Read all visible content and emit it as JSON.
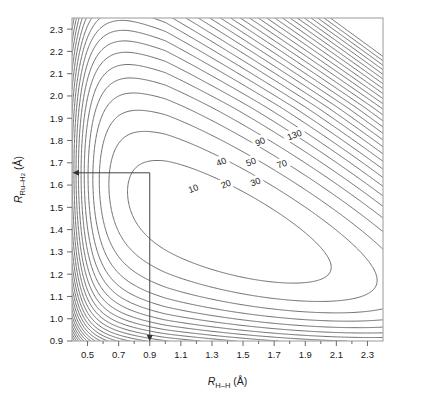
{
  "figure": {
    "kind": "contour-plot",
    "background": "#ffffff",
    "frame_color": "#9a9a9a",
    "contour_color": "#555555",
    "guide_color": "#333333"
  },
  "axes": {
    "x": {
      "label_prefix": "R",
      "label_sub": "H–H",
      "label_unit": "(Å)",
      "min": 0.4,
      "max": 2.4,
      "major_ticks": [
        0.5,
        0.7,
        0.9,
        1.1,
        1.3,
        1.5,
        1.7,
        1.9,
        2.1,
        2.3
      ],
      "minor_ticks": [
        0.6,
        0.8,
        1.0,
        1.2,
        1.4,
        1.6,
        1.8,
        2.0,
        2.2
      ],
      "tick_labels": [
        "0.5",
        "0.7",
        "0.9",
        "1.1",
        "1.3",
        "1.5",
        "1.7",
        "1.9",
        "2.1",
        "2.3"
      ]
    },
    "y": {
      "label_prefix": "R",
      "label_sub": "Ru–H",
      "label_sub2": "2",
      "label_unit": "(Å)",
      "min": 0.9,
      "max": 2.35,
      "major_ticks": [
        0.9,
        1.0,
        1.1,
        1.2,
        1.3,
        1.4,
        1.5,
        1.6,
        1.7,
        1.8,
        1.9,
        2.0,
        2.1,
        2.2,
        2.3
      ],
      "tick_labels": [
        "0.9",
        "1.0",
        "1.1",
        "1.2",
        "1.3",
        "1.4",
        "1.5",
        "1.6",
        "1.7",
        "1.8",
        "1.9",
        "2.0",
        "2.1",
        "2.2",
        "2.3"
      ]
    }
  },
  "guide": {
    "name": "minimum-marker",
    "x_value": 0.9,
    "y_value": 1.655,
    "horizontal_arrow_to": "y-axis",
    "vertical_arrow_to": "x-axis"
  },
  "chart_data": {
    "type": "contour",
    "title": "",
    "xlabel": "R_H-H (Å)",
    "ylabel": "R_Ru-H2 (Å)",
    "xlim": [
      0.4,
      2.4
    ],
    "ylim": [
      0.9,
      2.35
    ],
    "grid": false,
    "legend": "none",
    "contour_unit": "kcal/mol",
    "labeled_levels": [
      10,
      20,
      30,
      40,
      50,
      70,
      90,
      130
    ],
    "level_step": 10,
    "n_contours": 30,
    "minimum_estimate": {
      "x": 1.55,
      "y": 1.45,
      "value": 0
    },
    "marked_point": {
      "x": 0.9,
      "y": 1.655
    },
    "contour_labels": [
      {
        "value": "10",
        "x": 1.18,
        "y": 1.585,
        "rot": -22
      },
      {
        "value": "20",
        "x": 1.39,
        "y": 1.605,
        "rot": -22
      },
      {
        "value": "30",
        "x": 1.58,
        "y": 1.615,
        "rot": -20
      },
      {
        "value": "40",
        "x": 1.36,
        "y": 1.705,
        "rot": -22
      },
      {
        "value": "50",
        "x": 1.55,
        "y": 1.705,
        "rot": -20
      },
      {
        "value": "70",
        "x": 1.75,
        "y": 1.695,
        "rot": -20
      },
      {
        "value": "90",
        "x": 1.61,
        "y": 1.795,
        "rot": -22
      },
      {
        "value": "130",
        "x": 1.83,
        "y": 1.825,
        "rot": -20
      }
    ]
  }
}
